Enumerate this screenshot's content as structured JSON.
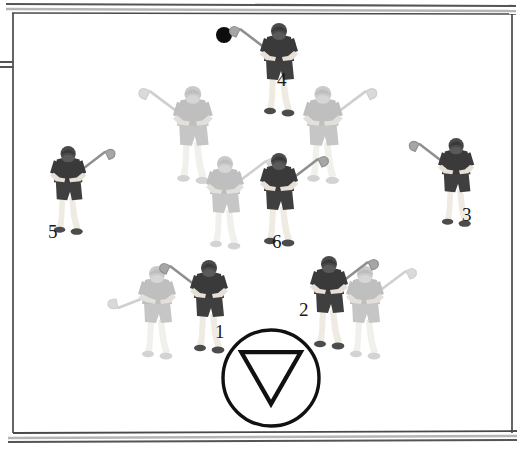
{
  "diagram": {
    "field": {
      "boundary_color": "#3a3a3a",
      "fill_color": "#ffffff",
      "top_line_label": "field-boundary-top",
      "bottom_line_label": "field-boundary-bottom",
      "gate_marker_label": "left-side-gate"
    },
    "ball": {
      "name": "ball",
      "color": "#0d0d0d",
      "x": 224,
      "y": 35,
      "radius": 8
    },
    "goal_marker": {
      "name": "goal-cone-marker",
      "shape": "circle-with-down-triangle",
      "color": "#111111",
      "cx": 271,
      "cy": 378,
      "r": 48
    },
    "colors": {
      "dark_jersey": "#4a4a4a",
      "dark_jersey_shirt": "#3b3b3b",
      "light_jersey": "#c9c9c9",
      "light_jersey_shirt": "#bdbdbd",
      "skin": "#e8e3dc",
      "stick": "#8c8c8c",
      "label_text": "#1a1a1a"
    },
    "players": [
      {
        "name": "player-4",
        "label": "4",
        "team": "dark",
        "x": 262,
        "y": 25,
        "scale": 1.0,
        "stick": "upper-left",
        "label_x": 277,
        "label_y": 70
      },
      {
        "name": "player-gray-upper-left",
        "label": "",
        "team": "light",
        "x": 175,
        "y": 88,
        "scale": 1.05,
        "stick": "upper-left",
        "label_x": 0,
        "label_y": 0
      },
      {
        "name": "player-gray-upper-right",
        "label": "",
        "team": "light",
        "x": 305,
        "y": 88,
        "scale": 1.05,
        "stick": "upper-right",
        "label_x": 0,
        "label_y": 0
      },
      {
        "name": "player-5",
        "label": "5",
        "team": "dark",
        "x": 52,
        "y": 148,
        "scale": 0.95,
        "stick": "upper-right",
        "label_x": 48,
        "label_y": 222
      },
      {
        "name": "player-3",
        "label": "3",
        "team": "dark",
        "x": 440,
        "y": 140,
        "scale": 0.95,
        "stick": "upper-left",
        "label_x": 462,
        "label_y": 205
      },
      {
        "name": "player-gray-center",
        "label": "",
        "team": "light",
        "x": 208,
        "y": 158,
        "scale": 1.0,
        "stick": "upper-right",
        "label_x": 0,
        "label_y": 0
      },
      {
        "name": "player-6",
        "label": "6",
        "team": "dark",
        "x": 262,
        "y": 155,
        "scale": 1.0,
        "stick": "upper-right",
        "label_x": 272,
        "label_y": 232
      },
      {
        "name": "player-gray-bottom-left",
        "label": "",
        "team": "light",
        "x": 140,
        "y": 268,
        "scale": 1.0,
        "stick": "lower-left",
        "label_x": 0,
        "label_y": 0
      },
      {
        "name": "player-1",
        "label": "1",
        "team": "dark",
        "x": 192,
        "y": 262,
        "scale": 1.0,
        "stick": "upper-left",
        "label_x": 215,
        "label_y": 322
      },
      {
        "name": "player-2",
        "label": "2",
        "team": "dark",
        "x": 312,
        "y": 258,
        "scale": 1.0,
        "stick": "upper-right",
        "label_x": 299,
        "label_y": 300
      },
      {
        "name": "player-gray-bottom-right",
        "label": "",
        "team": "light",
        "x": 348,
        "y": 268,
        "scale": 1.0,
        "stick": "upper-right",
        "label_x": 0,
        "label_y": 0
      }
    ]
  }
}
